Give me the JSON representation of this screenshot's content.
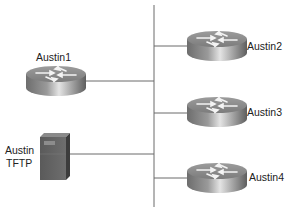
{
  "diagram": {
    "type": "network-topology",
    "bus": {
      "label": ""
    },
    "nodes": [
      {
        "id": "austin1",
        "kind": "router",
        "label": "Austin1"
      },
      {
        "id": "austin2",
        "kind": "router",
        "label": "Austin2"
      },
      {
        "id": "austin3",
        "kind": "router",
        "label": "Austin3"
      },
      {
        "id": "austin4",
        "kind": "router",
        "label": "Austin4"
      },
      {
        "id": "tftp",
        "kind": "server",
        "label_line1": "Austin",
        "label_line2": "TFTP"
      }
    ],
    "edges": [
      {
        "from": "austin1",
        "to": "bus"
      },
      {
        "from": "tftp",
        "to": "bus"
      },
      {
        "from": "austin2",
        "to": "bus"
      },
      {
        "from": "austin3",
        "to": "bus"
      },
      {
        "from": "austin4",
        "to": "bus"
      }
    ]
  }
}
